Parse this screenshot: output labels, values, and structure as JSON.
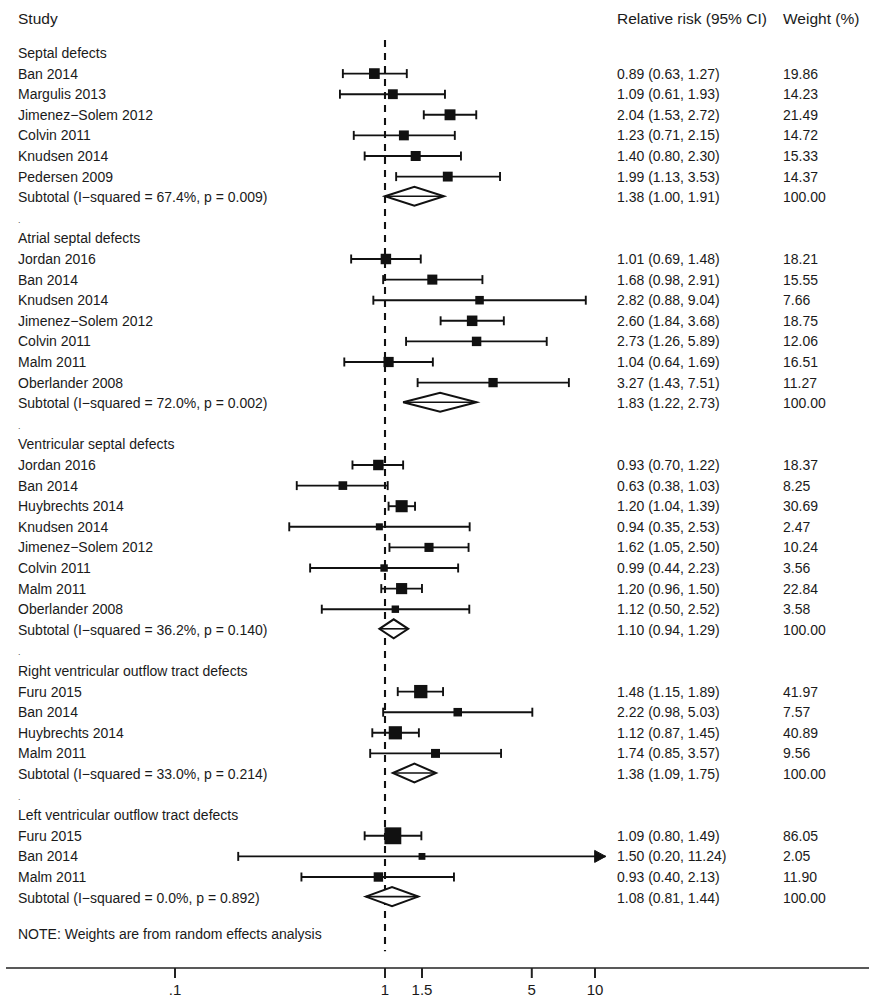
{
  "header": {
    "col_study": "Study",
    "col_effect": "Relative risk (95% CI)",
    "col_weight": "Weight (%)"
  },
  "note": "NOTE: Weights are from random effects analysis",
  "axis": {
    "scale": "log10",
    "ticks": [
      {
        "label": ".1",
        "value": 0.1
      },
      {
        "label": "1",
        "value": 1
      },
      {
        "label": "1.5",
        "value": 1.5
      },
      {
        "label": "5",
        "value": 5
      },
      {
        "label": "10",
        "value": 10
      }
    ],
    "reference_value": 1,
    "xlim": [
      0.07,
      14.5
    ]
  },
  "chart_data": {
    "type": "forest",
    "title": "",
    "xlabel": "",
    "ylabel": "",
    "effect_measure": "Relative risk (95% CI)",
    "x_scale": "log10",
    "x_ticks": [
      0.1,
      1,
      1.5,
      5,
      10
    ],
    "x_tick_labels": [
      ".1",
      "1",
      "1.5",
      "5",
      "10"
    ],
    "reference_line": 1,
    "note": "NOTE: Weights are from random effects analysis",
    "groups": [
      {
        "name": "Septal defects",
        "studies": [
          {
            "label": "Ban 2014",
            "rr": 0.89,
            "lo": 0.63,
            "hi": 1.27,
            "ci_text": "0.89 (0.63, 1.27)",
            "weight": 19.86,
            "weight_text": "19.86"
          },
          {
            "label": "Margulis 2013",
            "rr": 1.09,
            "lo": 0.61,
            "hi": 1.93,
            "ci_text": "1.09 (0.61, 1.93)",
            "weight": 14.23,
            "weight_text": "14.23"
          },
          {
            "label": "Jimenez−Solem 2012",
            "rr": 2.04,
            "lo": 1.53,
            "hi": 2.72,
            "ci_text": "2.04 (1.53, 2.72)",
            "weight": 21.49,
            "weight_text": "21.49"
          },
          {
            "label": "Colvin 2011",
            "rr": 1.23,
            "lo": 0.71,
            "hi": 2.15,
            "ci_text": "1.23 (0.71, 2.15)",
            "weight": 14.72,
            "weight_text": "14.72"
          },
          {
            "label": "Knudsen 2014",
            "rr": 1.4,
            "lo": 0.8,
            "hi": 2.3,
            "ci_text": "1.40 (0.80, 2.30)",
            "weight": 15.33,
            "weight_text": "15.33"
          },
          {
            "label": "Pedersen 2009",
            "rr": 1.99,
            "lo": 1.13,
            "hi": 3.53,
            "ci_text": "1.99 (1.13, 3.53)",
            "weight": 14.37,
            "weight_text": "14.37"
          }
        ],
        "subtotal": {
          "label": "Subtotal  (I−squared = 67.4%, p = 0.009)",
          "i_squared": "67.4%",
          "p": "0.009",
          "rr": 1.38,
          "lo": 1.0,
          "hi": 1.91,
          "ci_text": "1.38 (1.00, 1.91)",
          "weight_text": "100.00"
        }
      },
      {
        "name": "Atrial septal defects",
        "studies": [
          {
            "label": "Jordan 2016",
            "rr": 1.01,
            "lo": 0.69,
            "hi": 1.48,
            "ci_text": "1.01 (0.69, 1.48)",
            "weight": 18.21,
            "weight_text": "18.21"
          },
          {
            "label": "Ban 2014",
            "rr": 1.68,
            "lo": 0.98,
            "hi": 2.91,
            "ci_text": "1.68 (0.98, 2.91)",
            "weight": 15.55,
            "weight_text": "15.55"
          },
          {
            "label": "Knudsen 2014",
            "rr": 2.82,
            "lo": 0.88,
            "hi": 9.04,
            "ci_text": "2.82 (0.88, 9.04)",
            "weight": 7.66,
            "weight_text": "7.66"
          },
          {
            "label": "Jimenez−Solem 2012",
            "rr": 2.6,
            "lo": 1.84,
            "hi": 3.68,
            "ci_text": "2.60 (1.84, 3.68)",
            "weight": 18.75,
            "weight_text": "18.75"
          },
          {
            "label": "Colvin 2011",
            "rr": 2.73,
            "lo": 1.26,
            "hi": 5.89,
            "ci_text": "2.73 (1.26, 5.89)",
            "weight": 12.06,
            "weight_text": "12.06"
          },
          {
            "label": "Malm 2011",
            "rr": 1.04,
            "lo": 0.64,
            "hi": 1.69,
            "ci_text": "1.04 (0.64, 1.69)",
            "weight": 16.51,
            "weight_text": "16.51"
          },
          {
            "label": "Oberlander 2008",
            "rr": 3.27,
            "lo": 1.43,
            "hi": 7.51,
            "ci_text": "3.27 (1.43, 7.51)",
            "weight": 11.27,
            "weight_text": "11.27"
          }
        ],
        "subtotal": {
          "label": "Subtotal  (I−squared = 72.0%, p = 0.002)",
          "i_squared": "72.0%",
          "p": "0.002",
          "rr": 1.83,
          "lo": 1.22,
          "hi": 2.73,
          "ci_text": "1.83 (1.22, 2.73)",
          "weight_text": "100.00"
        }
      },
      {
        "name": "Ventricular septal defects",
        "studies": [
          {
            "label": "Jordan 2016",
            "rr": 0.93,
            "lo": 0.7,
            "hi": 1.22,
            "ci_text": "0.93 (0.70, 1.22)",
            "weight": 18.37,
            "weight_text": "18.37"
          },
          {
            "label": "Ban 2014",
            "rr": 0.63,
            "lo": 0.38,
            "hi": 1.03,
            "ci_text": "0.63 (0.38, 1.03)",
            "weight": 8.25,
            "weight_text": "8.25"
          },
          {
            "label": "Huybrechts 2014",
            "rr": 1.2,
            "lo": 1.04,
            "hi": 1.39,
            "ci_text": "1.20 (1.04, 1.39)",
            "weight": 30.69,
            "weight_text": "30.69"
          },
          {
            "label": "Knudsen 2014",
            "rr": 0.94,
            "lo": 0.35,
            "hi": 2.53,
            "ci_text": "0.94 (0.35, 2.53)",
            "weight": 2.47,
            "weight_text": "2.47"
          },
          {
            "label": "Jimenez−Solem 2012",
            "rr": 1.62,
            "lo": 1.05,
            "hi": 2.5,
            "ci_text": "1.62 (1.05, 2.50)",
            "weight": 10.24,
            "weight_text": "10.24"
          },
          {
            "label": "Colvin 2011",
            "rr": 0.99,
            "lo": 0.44,
            "hi": 2.23,
            "ci_text": "0.99 (0.44, 2.23)",
            "weight": 3.56,
            "weight_text": "3.56"
          },
          {
            "label": "Malm 2011",
            "rr": 1.2,
            "lo": 0.96,
            "hi": 1.5,
            "ci_text": "1.20 (0.96, 1.50)",
            "weight": 22.84,
            "weight_text": "22.84"
          },
          {
            "label": "Oberlander 2008",
            "rr": 1.12,
            "lo": 0.5,
            "hi": 2.52,
            "ci_text": "1.12 (0.50, 2.52)",
            "weight": 3.58,
            "weight_text": "3.58"
          }
        ],
        "subtotal": {
          "label": "Subtotal  (I−squared = 36.2%, p = 0.140)",
          "i_squared": "36.2%",
          "p": "0.140",
          "rr": 1.1,
          "lo": 0.94,
          "hi": 1.29,
          "ci_text": "1.10 (0.94, 1.29)",
          "weight_text": "100.00"
        }
      },
      {
        "name": "Right ventricular outflow tract defects",
        "studies": [
          {
            "label": "Furu 2015",
            "rr": 1.48,
            "lo": 1.15,
            "hi": 1.89,
            "ci_text": "1.48 (1.15, 1.89)",
            "weight": 41.97,
            "weight_text": "41.97"
          },
          {
            "label": "Ban 2014",
            "rr": 2.22,
            "lo": 0.98,
            "hi": 5.03,
            "ci_text": "2.22 (0.98, 5.03)",
            "weight": 7.57,
            "weight_text": "7.57"
          },
          {
            "label": "Huybrechts 2014",
            "rr": 1.12,
            "lo": 0.87,
            "hi": 1.45,
            "ci_text": "1.12 (0.87, 1.45)",
            "weight": 40.89,
            "weight_text": "40.89"
          },
          {
            "label": "Malm 2011",
            "rr": 1.74,
            "lo": 0.85,
            "hi": 3.57,
            "ci_text": "1.74 (0.85, 3.57)",
            "weight": 9.56,
            "weight_text": "9.56"
          }
        ],
        "subtotal": {
          "label": "Subtotal  (I−squared = 33.0%, p = 0.214)",
          "i_squared": "33.0%",
          "p": "0.214",
          "rr": 1.38,
          "lo": 1.09,
          "hi": 1.75,
          "ci_text": "1.38 (1.09, 1.75)",
          "weight_text": "100.00"
        }
      },
      {
        "name": "Left ventricular outflow tract defects",
        "studies": [
          {
            "label": "Furu 2015",
            "rr": 1.09,
            "lo": 0.8,
            "hi": 1.49,
            "ci_text": "1.09 (0.80, 1.49)",
            "weight": 86.05,
            "weight_text": "86.05"
          },
          {
            "label": "Ban 2014",
            "rr": 1.5,
            "lo": 0.2,
            "hi": 11.24,
            "ci_text": "1.50 (0.20, 11.24)",
            "weight": 2.05,
            "weight_text": "2.05",
            "truncated_hi": true
          },
          {
            "label": "Malm 2011",
            "rr": 0.93,
            "lo": 0.4,
            "hi": 2.13,
            "ci_text": "0.93 (0.40, 2.13)",
            "weight": 11.9,
            "weight_text": "11.90"
          }
        ],
        "subtotal": {
          "label": "Subtotal  (I−squared = 0.0%, p = 0.892)",
          "i_squared": "0.0%",
          "p": "0.892",
          "rr": 1.08,
          "lo": 0.81,
          "hi": 1.44,
          "ci_text": "1.08 (0.81, 1.44)",
          "weight_text": "100.00"
        }
      }
    ]
  }
}
